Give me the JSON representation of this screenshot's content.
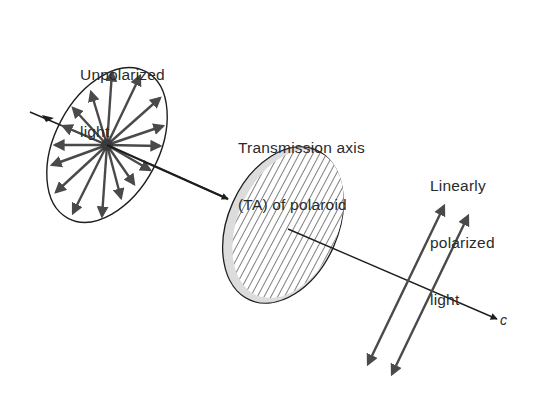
{
  "figure": {
    "labels": {
      "unpolarized": [
        "Unpolarized",
        "light"
      ],
      "transmission_axis": [
        "Transmission axis",
        "(TA) of polaroid"
      ],
      "linearly_polarized": [
        "Linearly",
        "polarized",
        "light"
      ],
      "propagation": "c"
    },
    "elements": {
      "unpolarized_ellipse": {
        "cx": 107,
        "cy": 145,
        "rx": 52,
        "ry": 82,
        "rotate": 28,
        "arrow_count": 16
      },
      "polaroid_disk": {
        "cx": 283,
        "cy": 225,
        "rx": 55,
        "ry": 82,
        "rotate": 24,
        "hatch": "diagonal"
      },
      "propagation_axis": {
        "x1": 30,
        "y1": 112,
        "x2": 497,
        "y2": 319
      },
      "polarized_arrows": [
        {
          "x1": 366,
          "y1": 368,
          "x2": 446,
          "y2": 202
        },
        {
          "x1": 390,
          "y1": 378,
          "x2": 470,
          "y2": 212
        }
      ]
    },
    "colors": {
      "line": "#1e1e1e",
      "arrow": "#4a4a4a",
      "rim": "#d8d8d8",
      "text": "#2b2b2b"
    }
  }
}
